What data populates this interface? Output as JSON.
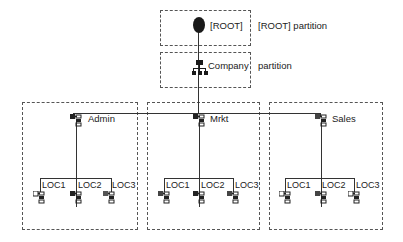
{
  "diagram": {
    "type": "tree",
    "root": {
      "label": "[ROOT]",
      "partition_label": "[ROOT] partition",
      "icon": "root-node-icon"
    },
    "company": {
      "label": "Company",
      "partition_label": "partition",
      "icon": "organization-icon"
    },
    "partitions": [
      {
        "label": "Admin",
        "icon": "org-unit-icon",
        "children": [
          {
            "label": "LOC1",
            "icon": "org-unit-icon"
          },
          {
            "label": "LOC2",
            "icon": "org-unit-icon"
          },
          {
            "label": "LOC3",
            "icon": "org-unit-icon"
          }
        ]
      },
      {
        "label": "Mrkt",
        "icon": "org-unit-icon",
        "children": [
          {
            "label": "LOC1",
            "icon": "org-unit-icon"
          },
          {
            "label": "LOC2",
            "icon": "org-unit-icon"
          },
          {
            "label": "LOC3",
            "icon": "org-unit-icon"
          }
        ]
      },
      {
        "label": "Sales",
        "icon": "org-unit-icon",
        "children": [
          {
            "label": "LOC1",
            "icon": "org-unit-icon"
          },
          {
            "label": "LOC2",
            "icon": "org-unit-icon"
          },
          {
            "label": "LOC3",
            "icon": "org-unit-icon"
          }
        ]
      }
    ],
    "colors": {
      "line": "#333333",
      "border": "#555555",
      "icon": "#222222"
    }
  }
}
